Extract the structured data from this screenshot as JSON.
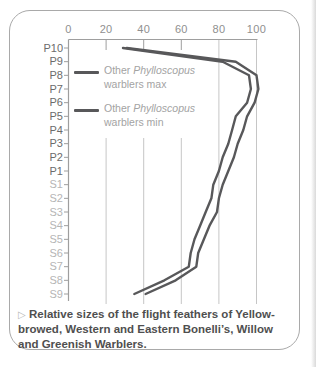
{
  "page": {
    "background": "#ffffff",
    "edge_shadow": "right"
  },
  "card": {
    "border_color": "#a9a9a9",
    "background": "#ffffff"
  },
  "chart_data": {
    "type": "line",
    "orientation": "horizontal-category",
    "title": "",
    "xlabel": "",
    "ylabel": "",
    "x_axis": {
      "position": "top",
      "ticks": [
        0,
        20,
        40,
        60,
        80,
        100
      ],
      "range": [
        0,
        100
      ]
    },
    "categories": [
      "P10",
      "P9",
      "P8",
      "P7",
      "P6",
      "P5",
      "P4",
      "P3",
      "P2",
      "P1",
      "S1",
      "S2",
      "S3",
      "S4",
      "S5",
      "S6",
      "S7",
      "S8",
      "S9"
    ],
    "category_groups": {
      "primaries": [
        "P10",
        "P9",
        "P8",
        "P7",
        "P6",
        "P5",
        "P4",
        "P3",
        "P2",
        "P1"
      ],
      "secondaries": [
        "S1",
        "S2",
        "S3",
        "S4",
        "S5",
        "S6",
        "S7",
        "S8",
        "S9"
      ]
    },
    "series": [
      {
        "name": "Other Phylloscopus warblers max",
        "values": [
          31,
          89,
          100,
          101,
          99,
          95,
          93,
          90,
          88,
          85,
          82,
          80,
          79,
          75,
          72,
          69,
          68,
          57,
          41
        ]
      },
      {
        "name": "Other Phylloscopus warblers min",
        "values": [
          29,
          82,
          96,
          97,
          95,
          89,
          87,
          85,
          82,
          80,
          77,
          76,
          73,
          70,
          67,
          65,
          64,
          51,
          35
        ]
      }
    ],
    "line_color": "#58585a",
    "grid": true,
    "grid_color": "#c6c6c6",
    "axis_color": "#9e9e9e",
    "legend_position": "upper-left-inside"
  },
  "legend": {
    "entries": [
      {
        "prefix": "Other ",
        "species": "Phylloscopus",
        "rest": " warblers max"
      },
      {
        "prefix": "Other ",
        "species": "Phylloscopus",
        "rest": " warblers min"
      }
    ]
  },
  "caption": {
    "marker": "▷",
    "text": "Relative sizes of the flight feathers of Yellow-browed, Western and Eastern Bonelli’s, Willow and Greenish Warblers."
  }
}
